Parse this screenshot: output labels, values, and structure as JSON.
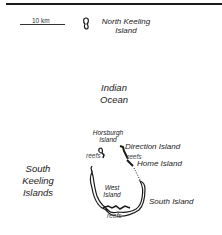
{
  "map": {
    "scale": {
      "label": "10 km"
    },
    "ocean": {
      "line1": "Indian",
      "line2": "Ocean"
    },
    "islands": {
      "north_keeling": {
        "line1": "North Keeling",
        "line2": "Island"
      },
      "horsburgh": {
        "line1": "Horsburgh",
        "line2": "Island"
      },
      "direction": {
        "label": "Direction Island"
      },
      "home": {
        "label": "Home Island"
      },
      "west": {
        "line1": "West",
        "line2": "Island"
      },
      "south": {
        "label": "South Island"
      },
      "south_keeling": {
        "line1": "South",
        "line2": "Keeling",
        "line3": "Islands"
      }
    },
    "reefs": {
      "label": "reefs"
    },
    "colors": {
      "land": "#ffffff",
      "outline": "#1a1a1a",
      "background": "#ffffff"
    }
  }
}
